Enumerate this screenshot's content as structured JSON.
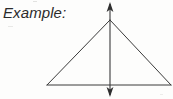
{
  "figure": {
    "label": "Example:",
    "caption_text": "Example:",
    "background_color": "#fdfdfc",
    "stroke_color": "#3a3a3a",
    "text_color": "#2b2b2b",
    "geometry": {
      "triangle": {
        "apex": {
          "x": 110,
          "y": 20
        },
        "left_vertex": {
          "x": 47,
          "y": 85
        },
        "right_vertex": {
          "x": 171,
          "y": 85
        }
      },
      "symmetry_axis": {
        "type": "double-headed-arrow",
        "x": 110,
        "top_y": 3,
        "bottom_y": 96,
        "arrow_top": "up",
        "arrow_bottom": "down"
      }
    }
  }
}
